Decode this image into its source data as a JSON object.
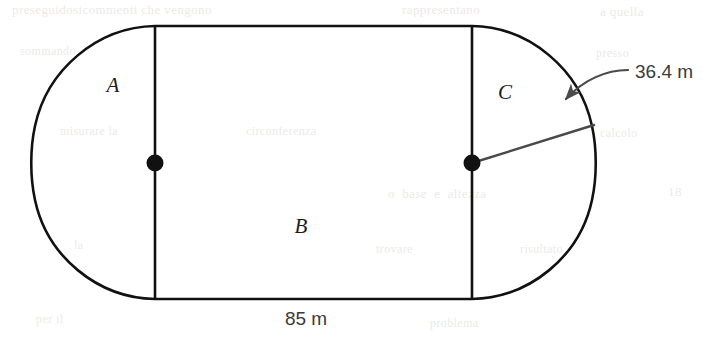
{
  "figure": {
    "background_color": "#ffffff",
    "stroke_color": "#111111",
    "annotation_color": "#555555",
    "regions": [
      {
        "key": "A",
        "label": "A",
        "shape": "semicircle-left"
      },
      {
        "key": "B",
        "label": "B",
        "shape": "rectangle-middle"
      },
      {
        "key": "C",
        "label": "C",
        "shape": "semicircle-right"
      }
    ],
    "dimensions": [
      {
        "key": "length",
        "label": "85 m",
        "value": 85,
        "unit": "m",
        "applies_to": "B",
        "position": "below-bottom-edge"
      },
      {
        "key": "radius",
        "label": "36.4 m",
        "value": 36.4,
        "unit": "m",
        "applies_to": "C",
        "position": "upper-right"
      }
    ],
    "markers": [
      {
        "key": "center-left",
        "label": "center-dot-left"
      },
      {
        "key": "center-right",
        "label": "center-dot-right"
      }
    ],
    "leader": {
      "key": "radius-arrow",
      "label": "curved-arrow-to-radius"
    }
  },
  "ghost_text": {
    "lines": [
      {
        "text": "preseguidosicommenti che vengono",
        "x": 12,
        "y": 2,
        "size": 13
      },
      {
        "text": "rappresentano",
        "x": 402,
        "y": 2,
        "size": 13
      },
      {
        "text": "a quella",
        "x": 600,
        "y": 4,
        "size": 13
      },
      {
        "text": "sommando",
        "x": 20,
        "y": 44,
        "size": 12
      },
      {
        "text": "presso",
        "x": 596,
        "y": 46,
        "size": 12
      },
      {
        "text": "misurare la",
        "x": 60,
        "y": 124,
        "size": 12
      },
      {
        "text": "circonferenza",
        "x": 246,
        "y": 124,
        "size": 12
      },
      {
        "text": "calcolo",
        "x": 600,
        "y": 126,
        "size": 12
      },
      {
        "text": "o  base  e  altezza",
        "x": 388,
        "y": 186,
        "size": 13
      },
      {
        "text": "18",
        "x": 668,
        "y": 184,
        "size": 13
      },
      {
        "text": "la",
        "x": 74,
        "y": 238,
        "size": 12
      },
      {
        "text": "trovare",
        "x": 376,
        "y": 242,
        "size": 12
      },
      {
        "text": "risultato",
        "x": 520,
        "y": 242,
        "size": 12
      },
      {
        "text": "per il",
        "x": 36,
        "y": 312,
        "size": 12
      },
      {
        "text": "problema",
        "x": 430,
        "y": 316,
        "size": 12
      }
    ]
  },
  "geometry": {
    "rect_left_x": 155,
    "rect_right_x": 472,
    "top_y": 26,
    "bottom_y": 299,
    "arc_left_x": 23,
    "arc_right_x": 605,
    "center_y": 163,
    "dot_radius": 8,
    "radius_line_end_x": 592,
    "radius_line_end_y": 126
  }
}
